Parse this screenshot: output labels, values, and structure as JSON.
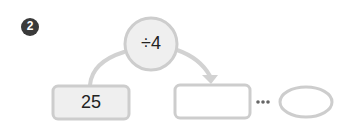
{
  "problem": {
    "number": "2",
    "operator_label": "÷4",
    "start_value": "25",
    "result_box_value": "",
    "ellipse_value": "",
    "ellipsis": "···"
  },
  "colors": {
    "badge": "#3a3a3a",
    "shape_fill": "#f0f0f0",
    "shape_stroke": "#c9c9c9",
    "arrow": "#cfcfcf",
    "dots": "#666666"
  }
}
